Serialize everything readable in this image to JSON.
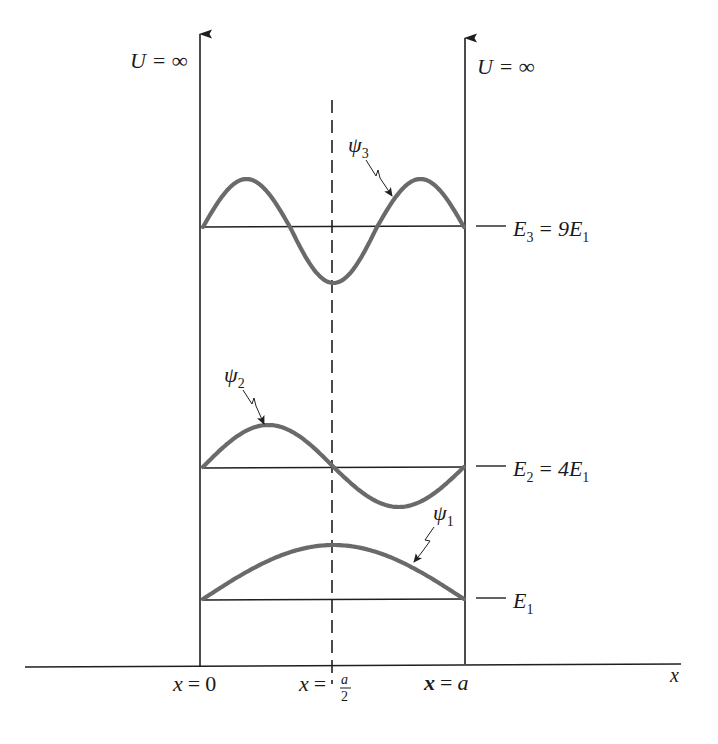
{
  "figure": {
    "type": "infinite-square-well-energy-levels",
    "walls": {
      "left_label": "U = ∞",
      "right_label": "U = ∞"
    },
    "x_axis": {
      "label": "x",
      "ticks": [
        {
          "label_var": "x",
          "label_eq": "=",
          "label_val": "0"
        },
        {
          "label_var": "x",
          "label_eq": "=",
          "label_num": "a",
          "label_den": "2"
        },
        {
          "label_var": "x",
          "label_eq": "=",
          "label_val": "a"
        }
      ]
    },
    "levels": [
      {
        "name": "E1",
        "sym": "E",
        "sub": "1",
        "eq": "",
        "rhs": "",
        "rhs_sub": ""
      },
      {
        "name": "E2",
        "sym": "E",
        "sub": "2",
        "eq": "=",
        "rhs": "4E",
        "rhs_sub": "1"
      },
      {
        "name": "E3",
        "sym": "E",
        "sub": "3",
        "eq": "=",
        "rhs": "9E",
        "rhs_sub": "1"
      }
    ],
    "wavefunctions": [
      {
        "name": "psi1",
        "sym": "ψ",
        "sub": "1",
        "n": 1
      },
      {
        "name": "psi2",
        "sym": "ψ",
        "sub": "2",
        "n": 2
      },
      {
        "name": "psi3",
        "sym": "ψ",
        "sub": "3",
        "n": 3
      }
    ],
    "colors": {
      "wave": "#6a6a6a",
      "lines": "#1f1f1f",
      "background": "#ffffff"
    }
  }
}
